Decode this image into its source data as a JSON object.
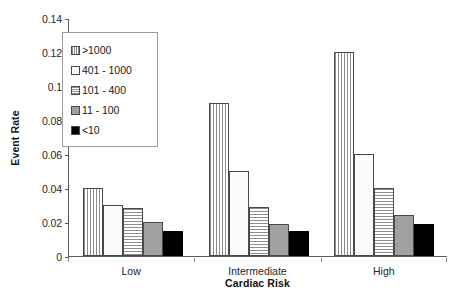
{
  "chart_data": {
    "type": "bar",
    "title": "",
    "xlabel": "Cardiac Risk",
    "ylabel": "Event Rate",
    "categories": [
      "Low",
      "Intermediate",
      "High"
    ],
    "series": [
      {
        "name": ">1000",
        "pattern": "vertical-lines",
        "values": [
          0.04,
          0.09,
          0.12
        ]
      },
      {
        "name": "401 - 1000",
        "pattern": "white",
        "values": [
          0.03,
          0.05,
          0.06
        ]
      },
      {
        "name": "101 - 400",
        "pattern": "horizontal-lines",
        "values": [
          0.028,
          0.029,
          0.04
        ]
      },
      {
        "name": "11 - 100",
        "pattern": "solid-gray",
        "values": [
          0.02,
          0.019,
          0.024
        ]
      },
      {
        "name": "<10",
        "pattern": "solid-black",
        "values": [
          0.015,
          0.015,
          0.019
        ]
      }
    ],
    "ylim": [
      0,
      0.14
    ],
    "yticks": [
      "0",
      "0.02",
      "0.04",
      "0.06",
      "0.08",
      "0.1",
      "0.12",
      "0.14"
    ],
    "ytick_values": [
      0,
      0.02,
      0.04,
      0.06,
      0.08,
      0.1,
      0.12,
      0.14
    ],
    "grid": false,
    "legend_position": "inside-top-left",
    "colors": {
      "axis": "#5a5a5a",
      "bar_outline": "#4a4a4a",
      "pattern_gray": "#8e8e8e",
      "solid_gray": "#a0a0a0",
      "solid_black": "#000000",
      "background": "#ffffff"
    }
  }
}
